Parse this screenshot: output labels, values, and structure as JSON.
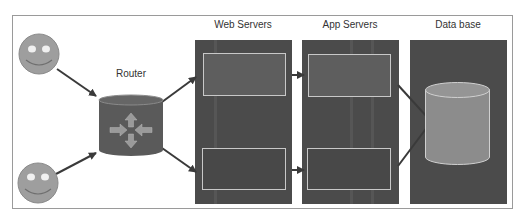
{
  "diagram": {
    "labels": {
      "router": "Router",
      "web_servers": "Web Servers",
      "app_servers": "App Servers",
      "database": "Data base"
    },
    "nodes": {
      "users": [
        {
          "id": "user-top",
          "icon": "smiley-face-icon"
        },
        {
          "id": "user-bottom",
          "icon": "smiley-face-icon"
        }
      ],
      "router": {
        "icon": "router-arrows-icon"
      },
      "web_servers": {
        "count": 2
      },
      "app_servers": {
        "count": 2
      },
      "database": {
        "icon": "database-cylinder-icon"
      }
    },
    "colors": {
      "frame": "#9a9a9a",
      "panel": "#4b4b4b",
      "server_box_top": "#5e5e5e",
      "server_box_bottom": "#4a4a4a",
      "box_border": "#c8c8c8",
      "face": "#9e9e9e",
      "router_body": "#5a5a5a",
      "router_arrows": "#9a9a9a",
      "db_body": "#8c8c8c",
      "arrow": "#3a3a3a"
    }
  }
}
